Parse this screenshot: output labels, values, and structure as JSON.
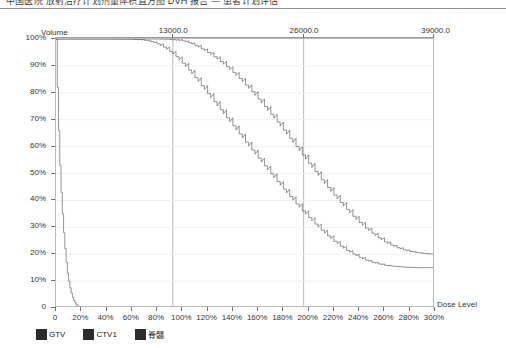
{
  "header": {
    "text": "中国医院 放射治疗计划剂量体积直方图 DVH 报告 — 患者计划评估"
  },
  "chart_data": {
    "type": "line",
    "title": "",
    "xlabel": "Dose Level",
    "ylabel": "Volume",
    "grid": true,
    "legend_position": "bottom-left",
    "xlim": [
      0,
      300
    ],
    "ylim": [
      0,
      100
    ],
    "x_tick_labels": [
      "0",
      "20%",
      "40%",
      "60%",
      "80%",
      "100%",
      "120%",
      "140%",
      "160%",
      "180%",
      "200%",
      "220%",
      "240%",
      "260%",
      "280%",
      "300%"
    ],
    "x_tick_values": [
      0,
      20,
      40,
      60,
      80,
      100,
      120,
      140,
      160,
      180,
      200,
      220,
      240,
      260,
      280,
      300
    ],
    "y_tick_labels": [
      "0",
      "10%",
      "20%",
      "30%",
      "40%",
      "50%",
      "60%",
      "70%",
      "80%",
      "90%",
      "100%"
    ],
    "y_tick_values": [
      0,
      10,
      20,
      30,
      40,
      50,
      60,
      70,
      80,
      90,
      100
    ],
    "top_axis": {
      "label": "",
      "tick_labels": [
        "13000.0",
        "26000.0",
        "39000.0"
      ],
      "tick_values": [
        92.5,
        196.0,
        300.0
      ],
      "gridlines": [
        92.5,
        196.0,
        300.0
      ]
    },
    "series": [
      {
        "name": "GTV",
        "color": "#2b2b2b",
        "x": [
          0,
          20,
          40,
          60,
          80,
          90,
          100,
          105,
          110,
          115,
          120,
          125,
          130,
          135,
          140,
          145,
          150,
          155,
          160,
          165,
          170,
          175,
          180,
          185,
          190,
          195,
          200,
          205,
          210,
          215,
          220,
          225,
          230,
          235,
          240,
          245,
          250,
          255,
          260,
          265,
          270,
          275,
          280,
          285,
          290,
          295,
          300
        ],
        "y": [
          100,
          100,
          100,
          100,
          100,
          99.8,
          99.3,
          98.6,
          97.6,
          96.3,
          95.0,
          93.4,
          91.6,
          89.7,
          87.6,
          85.3,
          82.9,
          80.4,
          77.7,
          74.9,
          72.0,
          69.1,
          66.1,
          63.1,
          60.0,
          56.9,
          53.8,
          50.7,
          47.7,
          44.8,
          41.9,
          39.2,
          36.6,
          34.1,
          31.8,
          29.7,
          27.8,
          26.1,
          24.6,
          23.4,
          22.4,
          21.6,
          21.0,
          20.6,
          20.3,
          20.1,
          20.0
        ]
      },
      {
        "name": "CTV1",
        "color": "#2b2b2b",
        "x": [
          0,
          20,
          40,
          60,
          70,
          75,
          80,
          85,
          90,
          95,
          100,
          105,
          110,
          115,
          120,
          125,
          130,
          135,
          140,
          145,
          150,
          155,
          160,
          165,
          170,
          175,
          180,
          185,
          190,
          195,
          200,
          205,
          210,
          215,
          220,
          225,
          230,
          235,
          240,
          245,
          250,
          255,
          260,
          265,
          270,
          275,
          280,
          285,
          290,
          295,
          300
        ],
        "y": [
          100,
          100,
          100,
          99.9,
          99.5,
          99.0,
          98.2,
          97.0,
          95.4,
          93.4,
          91.0,
          88.4,
          85.6,
          82.7,
          79.7,
          76.7,
          73.7,
          70.7,
          67.7,
          64.7,
          61.7,
          58.7,
          55.7,
          52.8,
          49.9,
          47.0,
          44.2,
          41.4,
          38.7,
          36.1,
          33.6,
          31.2,
          28.9,
          26.8,
          24.8,
          23.0,
          21.4,
          20.0,
          18.8,
          17.8,
          17.0,
          16.4,
          15.9,
          15.6,
          15.4,
          15.2,
          15.1,
          15.0,
          15.0,
          15.0,
          15.0
        ]
      },
      {
        "name": "脊髓",
        "color": "#2b2b2b",
        "x": [
          0,
          1,
          2,
          3,
          4,
          5,
          6,
          7,
          8,
          9,
          10,
          11,
          12,
          13,
          14,
          15,
          16,
          17,
          18,
          20,
          22,
          25,
          30
        ],
        "y": [
          100,
          82,
          66,
          53,
          43,
          35,
          28,
          22,
          17,
          13,
          10,
          7.5,
          5.5,
          4.0,
          2.8,
          1.9,
          1.2,
          0.8,
          0.5,
          0.2,
          0.1,
          0.0,
          0.0
        ]
      }
    ]
  },
  "legend": {
    "items": [
      {
        "label": "GTV",
        "color": "#2b2b2b"
      },
      {
        "label": "CTV1",
        "color": "#2b2b2b"
      },
      {
        "label": "脊髓",
        "color": "#2b2b2b"
      }
    ]
  }
}
